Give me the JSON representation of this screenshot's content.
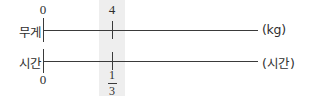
{
  "diagram": {
    "highlight_color": "#eeeeee",
    "line_color": "#3a3a3a",
    "rows": [
      {
        "label": "무게",
        "unit": "(kg)",
        "origin_value": "0",
        "marked_value": "4"
      },
      {
        "label": "시간",
        "unit": "(시간)",
        "origin_value": "0",
        "marked_value_numerator": "1",
        "marked_value_denominator": "3"
      }
    ]
  },
  "chart_data": {
    "type": "table",
    "axes": [
      {
        "name": "무게",
        "unit": "kg",
        "ticks": [
          "0",
          "4"
        ],
        "tick_positions": [
          0,
          1
        ]
      },
      {
        "name": "시간",
        "unit": "시간",
        "ticks": [
          "0",
          "1/3"
        ],
        "tick_positions": [
          0,
          1
        ]
      }
    ],
    "highlighted_pair": {
      "무게": "4 kg",
      "시간": "1/3 시간"
    },
    "grid": false,
    "legend": "none"
  }
}
